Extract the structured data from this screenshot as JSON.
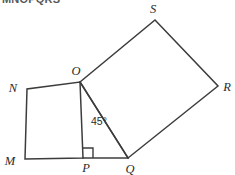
{
  "figure": {
    "clipped_caption": "MNOPQRS",
    "background_color": "#ffffff",
    "line_color": "#3c3c3c",
    "label_color": "#2b2b2b"
  },
  "labels": {
    "M": "M",
    "N": "N",
    "O": "O",
    "P": "P",
    "Q": "Q",
    "R": "R",
    "S": "S"
  },
  "annotations": {
    "angle_OQ_from_OP": "45°"
  },
  "geometry": {
    "points": {
      "M": [
        25,
        159
      ],
      "N": [
        27,
        89
      ],
      "O": [
        80,
        82
      ],
      "P": [
        83,
        158
      ],
      "Q": [
        128,
        158
      ],
      "R": [
        218,
        86
      ],
      "S": [
        155,
        20
      ]
    },
    "shapes": [
      {
        "name": "square-MNOP",
        "vertices": [
          "M",
          "N",
          "O",
          "P"
        ]
      },
      {
        "name": "square-OSRQ",
        "vertices": [
          "O",
          "S",
          "R",
          "Q"
        ]
      }
    ],
    "segments": [
      {
        "name": "segment-OQ-diagonal",
        "from": "O",
        "to": "Q"
      },
      {
        "name": "segment-PQ-base",
        "from": "P",
        "to": "Q"
      }
    ],
    "right_angle_at": "P"
  }
}
